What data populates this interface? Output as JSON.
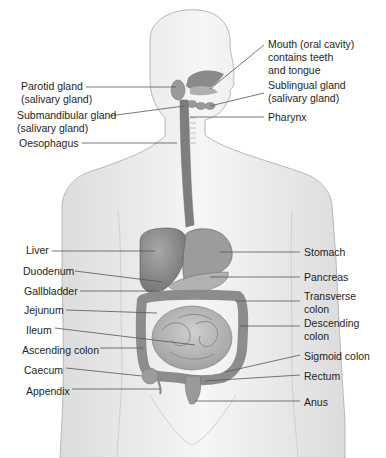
{
  "diagram": {
    "colors": {
      "skin": "#ececec",
      "skin_outline": "#b5b5b5",
      "organ_dark": "#7e7e7e",
      "organ_mid": "#9a9a9a",
      "organ_light": "#b8b8b8",
      "leader_line": "#555555",
      "text": "#1e1e1e"
    },
    "labels_left": [
      {
        "id": "parotid",
        "text": "Parotid gland\n(salivary gland)",
        "x": 21,
        "y": 80
      },
      {
        "id": "submandibular",
        "text": "Submandibular gland\n(salivary gland)",
        "x": 17,
        "y": 109
      },
      {
        "id": "oesophagus",
        "text": "Oesophagus",
        "x": 19,
        "y": 137
      },
      {
        "id": "liver",
        "text": "Liver",
        "x": 26,
        "y": 244
      },
      {
        "id": "duodenum",
        "text": "Duodenum",
        "x": 23,
        "y": 265
      },
      {
        "id": "gallbladder",
        "text": "Gallbladder",
        "x": 24,
        "y": 285
      },
      {
        "id": "jejunum",
        "text": "Jejunum",
        "x": 24,
        "y": 304
      },
      {
        "id": "ileum",
        "text": "Ileum",
        "x": 26,
        "y": 324
      },
      {
        "id": "ascending_colon",
        "text": "Ascending colon",
        "x": 22,
        "y": 344
      },
      {
        "id": "caecum",
        "text": "Caecum",
        "x": 24,
        "y": 364
      },
      {
        "id": "appendix",
        "text": "Appendix",
        "x": 26,
        "y": 385
      }
    ],
    "labels_right": [
      {
        "id": "mouth",
        "text": "Mouth (oral cavity)\ncontains teeth\nand tongue",
        "x": 268,
        "y": 38
      },
      {
        "id": "sublingual",
        "text": "Sublingual gland\n(salivary gland)",
        "x": 268,
        "y": 79
      },
      {
        "id": "pharynx",
        "text": "Pharynx",
        "x": 268,
        "y": 111
      },
      {
        "id": "stomach",
        "text": "Stomach",
        "x": 304,
        "y": 246
      },
      {
        "id": "pancreas",
        "text": "Pancreas",
        "x": 304,
        "y": 271
      },
      {
        "id": "transverse_colon",
        "text": "Transverse\ncolon",
        "x": 304,
        "y": 290
      },
      {
        "id": "descending_colon",
        "text": "Descending\ncolon",
        "x": 304,
        "y": 317
      },
      {
        "id": "sigmoid_colon",
        "text": "Sigmoid colon",
        "x": 304,
        "y": 350
      },
      {
        "id": "rectum",
        "text": "Rectum",
        "x": 304,
        "y": 370
      },
      {
        "id": "anus",
        "text": "Anus",
        "x": 304,
        "y": 396
      }
    ],
    "leader_lines": [
      {
        "id": "parotid",
        "x1": 86,
        "y1": 87,
        "x2": 176,
        "y2": 87
      },
      {
        "id": "submandibular",
        "x1": 109,
        "y1": 116,
        "x2": 184,
        "y2": 106
      },
      {
        "id": "oesophagus",
        "x1": 82,
        "y1": 143,
        "x2": 177,
        "y2": 143
      },
      {
        "id": "mouth",
        "x1": 264,
        "y1": 45,
        "x2": 210,
        "y2": 89
      },
      {
        "id": "sublingual",
        "x1": 264,
        "y1": 93,
        "x2": 210,
        "y2": 106
      },
      {
        "id": "pharynx",
        "x1": 264,
        "y1": 117,
        "x2": 190,
        "y2": 117
      },
      {
        "id": "liver",
        "x1": 52,
        "y1": 251,
        "x2": 155,
        "y2": 251
      },
      {
        "id": "duodenum",
        "x1": 75,
        "y1": 271,
        "x2": 163,
        "y2": 282
      },
      {
        "id": "gallbladder",
        "x1": 80,
        "y1": 291,
        "x2": 160,
        "y2": 291
      },
      {
        "id": "jejunum",
        "x1": 66,
        "y1": 310,
        "x2": 157,
        "y2": 313
      },
      {
        "id": "ileum",
        "x1": 55,
        "y1": 328,
        "x2": 195,
        "y2": 345
      },
      {
        "id": "ascending_colon",
        "x1": 100,
        "y1": 348,
        "x2": 143,
        "y2": 348
      },
      {
        "id": "caecum",
        "x1": 66,
        "y1": 368,
        "x2": 142,
        "y2": 376
      },
      {
        "id": "appendix",
        "x1": 72,
        "y1": 389,
        "x2": 160,
        "y2": 389
      },
      {
        "id": "stomach",
        "x1": 300,
        "y1": 252,
        "x2": 220,
        "y2": 252
      },
      {
        "id": "pancreas",
        "x1": 300,
        "y1": 277,
        "x2": 210,
        "y2": 277
      },
      {
        "id": "transverse_colon",
        "x1": 300,
        "y1": 301,
        "x2": 235,
        "y2": 301
      },
      {
        "id": "descending_colon",
        "x1": 300,
        "y1": 326,
        "x2": 240,
        "y2": 326
      },
      {
        "id": "sigmoid_colon",
        "x1": 300,
        "y1": 355,
        "x2": 225,
        "y2": 372
      },
      {
        "id": "rectum",
        "x1": 300,
        "y1": 375,
        "x2": 205,
        "y2": 381
      },
      {
        "id": "anus",
        "x1": 300,
        "y1": 401,
        "x2": 195,
        "y2": 401
      }
    ]
  }
}
